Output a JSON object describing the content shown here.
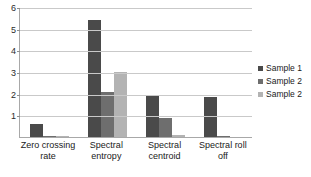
{
  "chart_data": {
    "type": "bar",
    "title": "",
    "subtitle": "",
    "xlabel": "",
    "ylabel": "",
    "ylim": [
      0,
      6
    ],
    "yticks": [
      1,
      2,
      3,
      4,
      5,
      6
    ],
    "grid": true,
    "legend_position": "right",
    "categories": [
      "Zero crossing rate",
      "Spectral entropy",
      "Spectral centroid",
      "Spectral roll off"
    ],
    "series": [
      {
        "name": "Sample 1",
        "color": "#4a4a4a",
        "values": [
          0.6,
          5.4,
          1.95,
          1.85
        ]
      },
      {
        "name": "Sample 2",
        "color": "#6e6e6e",
        "values": [
          0.05,
          2.1,
          0.9,
          0.05
        ]
      },
      {
        "name": "Sample 2",
        "color": "#b3b3b3",
        "values": [
          0.05,
          3.0,
          0.1,
          0.0
        ]
      }
    ]
  },
  "legend": {
    "items": [
      {
        "label": "Sample 1",
        "swatch_class": "s1"
      },
      {
        "label": "Sample 2",
        "swatch_class": "s2"
      },
      {
        "label": "Sample 2",
        "swatch_class": "s3"
      }
    ]
  },
  "axis": {
    "y_tick_labels": [
      "6",
      "5",
      "4",
      "3",
      "2",
      "1"
    ],
    "x_category_lines": [
      [
        "Zero crossing",
        "rate"
      ],
      [
        "Spectral",
        "entropy"
      ],
      [
        "Spectral",
        "centroid"
      ],
      [
        "Spectral roll",
        "off"
      ]
    ]
  },
  "colors": {
    "series_1": "#4a4a4a",
    "series_2": "#6e6e6e",
    "series_3": "#b3b3b3",
    "gridline": "#c9c9c9",
    "axis": "#a8a8a8",
    "background": "#ffffff"
  }
}
